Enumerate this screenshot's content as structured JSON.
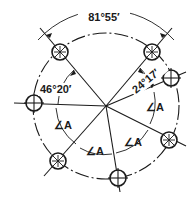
{
  "dimensions": {
    "top_angle": "81°55′",
    "left_angle": "46°20′",
    "right_angle": "24°17′",
    "equal_angle_label": "∠A"
  },
  "equal_angle_labels": [
    "∠A",
    "∠A",
    "∠A",
    "∠A"
  ],
  "holes": [
    {
      "id": "top-left",
      "style": "hatched"
    },
    {
      "id": "top-right",
      "style": "hatched"
    },
    {
      "id": "right-upper",
      "style": "cross"
    },
    {
      "id": "left",
      "style": "cross"
    },
    {
      "id": "right-lower",
      "style": "hatched"
    },
    {
      "id": "bottom-left",
      "style": "hatched"
    },
    {
      "id": "bottom",
      "style": "cross"
    }
  ]
}
